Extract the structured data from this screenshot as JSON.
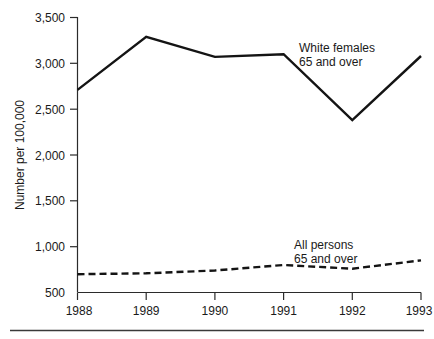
{
  "chart_data": {
    "type": "line",
    "title": "",
    "subtitle": "",
    "xlabel": "",
    "ylabel": "Number per 100,000",
    "categories": [
      "1988",
      "1989",
      "1990",
      "1991",
      "1992",
      "1993"
    ],
    "x": [
      1988,
      1989,
      1990,
      1991,
      1992,
      1993
    ],
    "xlim": [
      1988,
      1993
    ],
    "ylim": [
      500,
      3500
    ],
    "y_ticks": [
      500,
      1000,
      1500,
      2000,
      2500,
      3000,
      3500
    ],
    "y_tick_labels": [
      "500",
      "1,000",
      "1,500",
      "2,000",
      "2,500",
      "3,000",
      "3,500"
    ],
    "x_tick_labels": [
      "1988",
      "1989",
      "1990",
      "1991",
      "1992",
      "1993"
    ],
    "grid": false,
    "legend_position": "inline-annotation",
    "series": [
      {
        "name": "White females 65 and over",
        "label_line1": "White females",
        "label_line2": "65 and over",
        "style": "solid",
        "color": "#141414",
        "values": [
          2710,
          3290,
          3070,
          3100,
          2380,
          3080
        ]
      },
      {
        "name": "All persons 65 and over",
        "label_line1": "All persons",
        "label_line2": "65 and over",
        "style": "dashed",
        "color": "#141414",
        "values": [
          700,
          710,
          740,
          800,
          760,
          850
        ]
      }
    ],
    "annotations": [
      {
        "text": "White females 65 and over",
        "x": 1991.1,
        "y": 3180
      },
      {
        "text": "All persons 65 and over",
        "x": 1991.0,
        "y": 1020
      }
    ]
  },
  "axis": {
    "y_label": "Number per 100,000"
  },
  "labels": {
    "y_500": "500",
    "y_1000": "1,000",
    "y_1500": "1,500",
    "y_2000": "2,000",
    "y_2500": "2,500",
    "y_3000": "3,000",
    "y_3500": "3,500",
    "x_1988": "1988",
    "x_1989": "1989",
    "x_1990": "1990",
    "x_1991": "1991",
    "x_1992": "1992",
    "x_1993": "1993",
    "ann_white_1": "White females",
    "ann_white_2": "65 and over",
    "ann_all_1": "All persons",
    "ann_all_2": "65 and over"
  },
  "colors": {
    "series_line": "#141414",
    "axis": "#2b2b2b",
    "background": "#ffffff"
  }
}
